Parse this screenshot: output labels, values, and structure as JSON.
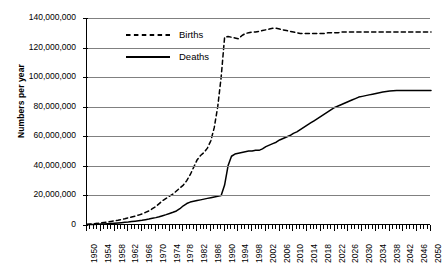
{
  "chart_data": {
    "type": "line",
    "title": "",
    "xlabel": "",
    "ylabel": "Numbers per year",
    "xlim": [
      1950,
      2050
    ],
    "ylim": [
      0,
      140000000
    ],
    "grid": true,
    "legend_position": "inside-top-left",
    "y_ticks": [
      "0",
      "20,000,000",
      "40,000,000",
      "60,000,000",
      "80,000,000",
      "100,000,000",
      "120,000,000",
      "140,000,000"
    ],
    "y_tick_values": [
      0,
      20000000,
      40000000,
      60000000,
      80000000,
      100000000,
      120000000,
      140000000
    ],
    "x_tick_labels": [
      "1950",
      "1954",
      "1958",
      "1962",
      "1966",
      "1970",
      "1974",
      "1978",
      "1982",
      "1986",
      "1990",
      "1994",
      "1998",
      "2002",
      "2006",
      "2010",
      "2014",
      "2018",
      "2022",
      "2026",
      "2030",
      "2034",
      "2038",
      "2042",
      "2046",
      "2050"
    ],
    "x_minor_tick_step": 1,
    "series": [
      {
        "name": "Births",
        "style": "dashed",
        "color": "#000000",
        "x": [
          1950,
          1951,
          1952,
          1953,
          1954,
          1955,
          1956,
          1957,
          1958,
          1959,
          1960,
          1961,
          1962,
          1963,
          1964,
          1965,
          1966,
          1967,
          1968,
          1969,
          1970,
          1971,
          1972,
          1973,
          1974,
          1975,
          1976,
          1977,
          1978,
          1979,
          1980,
          1981,
          1982,
          1983,
          1984,
          1985,
          1986,
          1987,
          1988,
          1989,
          1990,
          1991,
          1992,
          1993,
          1994,
          1995,
          1996,
          1997,
          1998,
          1999,
          2000,
          2001,
          2002,
          2003,
          2004,
          2005,
          2006,
          2007,
          2008,
          2009,
          2010,
          2011,
          2012,
          2013,
          2014,
          2015,
          2016,
          2017,
          2018,
          2019,
          2020,
          2021,
          2022,
          2023,
          2024,
          2025,
          2026,
          2027,
          2028,
          2029,
          2030,
          2031,
          2032,
          2033,
          2034,
          2035,
          2036,
          2037,
          2038,
          2039,
          2040,
          2041,
          2042,
          2043,
          2044,
          2045,
          2046,
          2047,
          2048,
          2049,
          2050
        ],
        "y": [
          500000,
          700000,
          900000,
          1100000,
          1400000,
          1700000,
          2000000,
          2400000,
          2800000,
          3200000,
          3700000,
          4200000,
          4800000,
          5400000,
          6000000,
          6700000,
          7500000,
          8500000,
          9500000,
          11000000,
          12500000,
          14500000,
          16500000,
          18000000,
          19500000,
          21000000,
          23000000,
          25000000,
          27000000,
          30000000,
          34000000,
          39000000,
          44000000,
          47000000,
          49000000,
          52000000,
          57000000,
          66000000,
          80000000,
          100000000,
          127000000,
          127500000,
          127000000,
          126500000,
          126000000,
          128000000,
          129500000,
          130000000,
          130500000,
          130500000,
          131000000,
          131500000,
          132000000,
          132500000,
          133000000,
          133000000,
          132500000,
          132000000,
          131500000,
          131000000,
          130500000,
          130000000,
          129500000,
          129500000,
          129500000,
          129500000,
          129500000,
          129500000,
          129500000,
          129500000,
          130000000,
          130000000,
          130000000,
          130000000,
          130500000,
          130500000,
          130500000,
          130500000,
          130500000,
          130500000,
          130500000,
          130500000,
          130500000,
          130500000,
          130500000,
          130500000,
          130500000,
          130500000,
          130500000,
          130500000,
          130500000,
          130500000,
          130500000,
          130500000,
          130500000,
          130500000,
          130500000,
          130500000,
          130500000,
          130500000,
          130500000
        ]
      },
      {
        "name": "Deaths",
        "style": "solid",
        "color": "#000000",
        "x": [
          1950,
          1951,
          1952,
          1953,
          1954,
          1955,
          1956,
          1957,
          1958,
          1959,
          1960,
          1961,
          1962,
          1963,
          1964,
          1965,
          1966,
          1967,
          1968,
          1969,
          1970,
          1971,
          1972,
          1973,
          1974,
          1975,
          1976,
          1977,
          1978,
          1979,
          1980,
          1981,
          1982,
          1983,
          1984,
          1985,
          1986,
          1987,
          1988,
          1989,
          1990,
          1991,
          1992,
          1993,
          1994,
          1995,
          1996,
          1997,
          1998,
          1999,
          2000,
          2001,
          2002,
          2003,
          2004,
          2005,
          2006,
          2007,
          2008,
          2009,
          2010,
          2011,
          2012,
          2013,
          2014,
          2015,
          2016,
          2017,
          2018,
          2019,
          2020,
          2021,
          2022,
          2023,
          2024,
          2025,
          2026,
          2027,
          2028,
          2029,
          2030,
          2031,
          2032,
          2033,
          2034,
          2035,
          2036,
          2037,
          2038,
          2039,
          2040,
          2041,
          2042,
          2043,
          2044,
          2045,
          2046,
          2047,
          2048,
          2049,
          2050
        ],
        "y": [
          200000,
          300000,
          400000,
          500000,
          600000,
          700000,
          850000,
          1000000,
          1200000,
          1400000,
          1600000,
          1800000,
          2000000,
          2300000,
          2600000,
          2900000,
          3200000,
          3600000,
          4000000,
          4500000,
          5000000,
          5600000,
          6300000,
          7000000,
          7800000,
          8600000,
          9500000,
          11000000,
          13000000,
          14500000,
          15500000,
          16000000,
          16500000,
          17000000,
          17500000,
          18000000,
          18500000,
          19000000,
          19500000,
          20000000,
          27000000,
          40000000,
          46500000,
          48000000,
          48500000,
          49000000,
          49500000,
          50000000,
          50000000,
          50500000,
          50500000,
          51500000,
          53000000,
          54000000,
          55000000,
          56000000,
          57500000,
          58500000,
          59500000,
          60500000,
          62000000,
          63000000,
          64500000,
          66000000,
          67500000,
          69000000,
          70500000,
          72000000,
          73500000,
          75000000,
          76500000,
          78000000,
          79500000,
          80500000,
          81500000,
          82500000,
          83500000,
          84500000,
          85500000,
          86500000,
          87000000,
          87500000,
          88000000,
          88500000,
          89000000,
          89500000,
          90000000,
          90300000,
          90600000,
          90800000,
          91000000,
          91000000,
          91000000,
          91000000,
          91000000,
          91000000,
          91000000,
          91000000,
          91000000,
          91000000,
          91000000
        ]
      }
    ]
  },
  "legend": {
    "items": [
      {
        "label": "Births",
        "style": "dashed"
      },
      {
        "label": "Deaths",
        "style": "solid"
      }
    ]
  }
}
